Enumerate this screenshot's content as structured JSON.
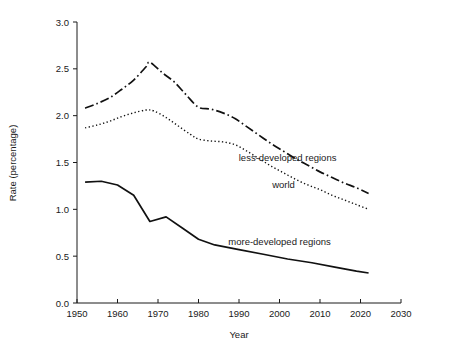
{
  "chart_data": {
    "type": "line",
    "title": "",
    "xlabel": "Year",
    "ylabel": "Rate (percentage)",
    "xlim": [
      1950,
      2030
    ],
    "ylim": [
      0.0,
      3.0
    ],
    "xticks": [
      1950,
      1960,
      1970,
      1980,
      1990,
      2000,
      2010,
      2020,
      2030
    ],
    "xtick_labels": [
      "1950",
      "1960",
      "1970",
      "1980",
      "1990",
      "2000",
      "2010",
      "2020",
      "2030"
    ],
    "yticks": [
      0.0,
      0.5,
      1.0,
      1.5,
      2.0,
      2.5,
      3.0
    ],
    "ytick_labels": [
      "0.0",
      "0.5",
      "1.0",
      "1.5",
      "2.0",
      "2.5",
      "3.0"
    ],
    "grid": false,
    "legend_position": "inline-annotations",
    "series": [
      {
        "name": "less-developed regions",
        "style": "dash-dot",
        "color": "#111111",
        "label_x": 2002,
        "label_y": 1.52,
        "x": [
          1952,
          1955,
          1958,
          1961,
          1964,
          1967,
          1968,
          1971,
          1974,
          1977,
          1980,
          1983,
          1986,
          1989,
          1992,
          1995,
          1998,
          2001,
          2004,
          2007,
          2010,
          2013,
          2016,
          2019,
          2022
        ],
        "values": [
          2.08,
          2.13,
          2.19,
          2.28,
          2.38,
          2.52,
          2.57,
          2.46,
          2.36,
          2.22,
          2.09,
          2.07,
          2.03,
          1.97,
          1.88,
          1.79,
          1.7,
          1.62,
          1.54,
          1.47,
          1.4,
          1.34,
          1.28,
          1.23,
          1.17
        ]
      },
      {
        "name": "world",
        "style": "dotted",
        "color": "#111111",
        "label_x": 2001,
        "label_y": 1.23,
        "x": [
          1952,
          1955,
          1958,
          1961,
          1964,
          1967,
          1969,
          1972,
          1975,
          1978,
          1980,
          1983,
          1986,
          1989,
          1992,
          1995,
          1998,
          2001,
          2004,
          2007,
          2010,
          2013,
          2016,
          2019,
          2022
        ],
        "values": [
          1.87,
          1.9,
          1.94,
          1.99,
          2.03,
          2.06,
          2.05,
          1.98,
          1.89,
          1.8,
          1.75,
          1.73,
          1.72,
          1.69,
          1.62,
          1.54,
          1.46,
          1.39,
          1.32,
          1.26,
          1.21,
          1.15,
          1.1,
          1.05,
          1.0
        ]
      },
      {
        "name": "more-developed regions",
        "style": "solid",
        "color": "#111111",
        "label_x": 2000,
        "label_y": 0.62,
        "x": [
          1952,
          1956,
          1960,
          1964,
          1968,
          1972,
          1976,
          1980,
          1984,
          1990,
          1996,
          2002,
          2008,
          2014,
          2019,
          2022
        ],
        "values": [
          1.29,
          1.3,
          1.26,
          1.15,
          0.87,
          0.92,
          0.8,
          0.68,
          0.62,
          0.57,
          0.52,
          0.47,
          0.43,
          0.38,
          0.34,
          0.32
        ]
      }
    ]
  },
  "geometry": {
    "plot_left": 77,
    "plot_right": 401,
    "plot_top": 22,
    "plot_bottom": 303
  }
}
